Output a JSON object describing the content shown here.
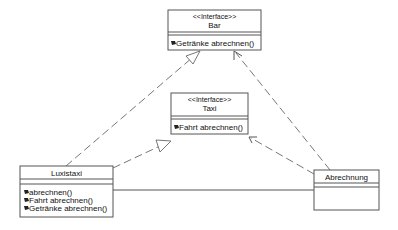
{
  "diagram": {
    "type": "uml-class-diagram",
    "classes": [
      {
        "id": "bar",
        "stereotype": "<<Interface>>",
        "name": "Bar",
        "attributes": [],
        "operations": [
          "Getränke abrechnen()"
        ]
      },
      {
        "id": "taxi",
        "stereotype": "<<Interface>>",
        "name": "Taxi",
        "attributes": [],
        "operations": [
          "Fahrt abrechnen()"
        ]
      },
      {
        "id": "luxistaxi",
        "name": "Luxistaxi",
        "attributes": [],
        "operations": [
          "abrechnen()",
          "Fahrt abrechnen()",
          "Getränke abrechnen()"
        ]
      },
      {
        "id": "abrechnung",
        "name": "Abrechnung",
        "attributes": [],
        "operations": []
      }
    ],
    "relations": [
      {
        "from": "luxistaxi",
        "to": "bar",
        "type": "realization"
      },
      {
        "from": "luxistaxi",
        "to": "taxi",
        "type": "realization"
      },
      {
        "from": "abrechnung",
        "to": "bar",
        "type": "dependency"
      },
      {
        "from": "abrechnung",
        "to": "taxi",
        "type": "dependency"
      },
      {
        "from": "luxistaxi",
        "to": "abrechnung",
        "type": "association"
      }
    ],
    "colors": {
      "background": "#ffffff",
      "border": "#555555",
      "text": "#111111"
    }
  }
}
